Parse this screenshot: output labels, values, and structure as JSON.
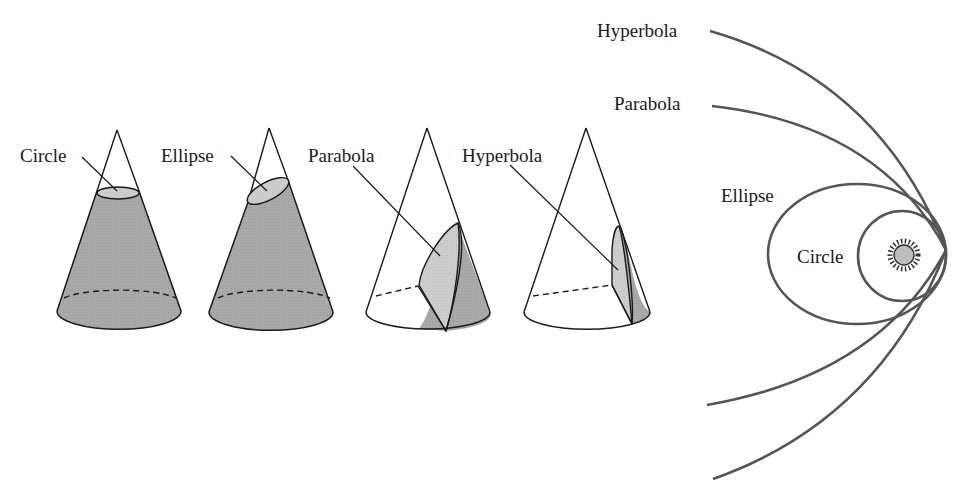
{
  "cones": [
    {
      "label": "Circle",
      "section": "circle"
    },
    {
      "label": "Ellipse",
      "section": "ellipse"
    },
    {
      "label": "Parabola",
      "section": "parabola"
    },
    {
      "label": "Hyperbola",
      "section": "hyperbola"
    }
  ],
  "orbits": {
    "labels": {
      "hyperbola": "Hyperbola",
      "parabola": "Parabola",
      "ellipse": "Ellipse",
      "circle": "Circle"
    },
    "center_object": "sun-icon"
  },
  "colors": {
    "cone_fill": "#a8a8a8",
    "section_fill": "#cfcfcf",
    "orbit_stroke": "#555555",
    "outline": "#1a1a1a"
  }
}
